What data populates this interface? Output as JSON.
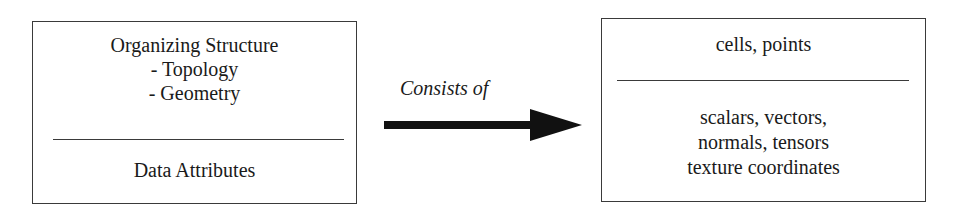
{
  "left_box": {
    "top_lines": [
      "Organizing Structure",
      "- Topology",
      "- Geometry"
    ],
    "bottom_lines": [
      "Data Attributes"
    ]
  },
  "connector": {
    "label": "Consists of",
    "arrow_icon": "right-arrow",
    "color": "#111111"
  },
  "right_box": {
    "top_lines": [
      "cells, points"
    ],
    "bottom_lines": [
      "scalars, vectors,",
      "normals, tensors",
      "texture coordinates"
    ]
  }
}
